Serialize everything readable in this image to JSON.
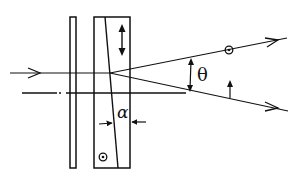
{
  "diagram": {
    "type": "optical-wedge-polarizer",
    "labels": {
      "theta": "θ",
      "alpha": "α"
    },
    "colors": {
      "line": "#111111",
      "background": "#ffffff"
    },
    "elements": [
      {
        "name": "incident-ray",
        "desc": "horizontal input ray with arrow"
      },
      {
        "name": "optical-axis",
        "desc": "dash-dot reference axis"
      },
      {
        "name": "thin-plate",
        "desc": "narrow vertical plate"
      },
      {
        "name": "wedge-prism",
        "desc": "rectangular block split by inclined interface"
      },
      {
        "name": "upper-output-ray",
        "desc": "output ray with out-of-plane polarization (circle-dot)"
      },
      {
        "name": "lower-output-ray",
        "desc": "output ray with in-plane polarization (up arrow)"
      },
      {
        "name": "divergence-angle",
        "desc": "angle theta between output rays"
      },
      {
        "name": "wedge-angle",
        "desc": "angle alpha of wedge interface"
      }
    ]
  }
}
